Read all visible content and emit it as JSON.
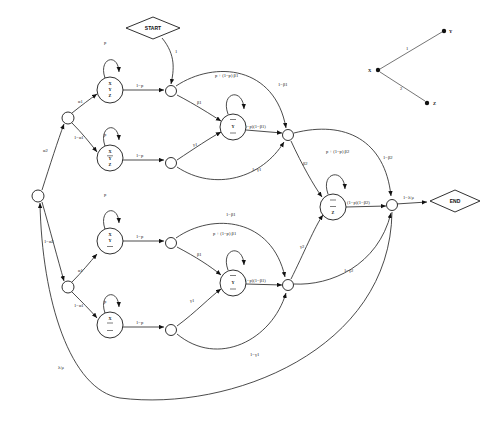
{
  "figure": {
    "type": "state-transition-diagram",
    "title": "",
    "terminals": {
      "start": "START",
      "end": "END"
    }
  },
  "nodes": [
    {
      "id": "n-split-a2",
      "kind": "small-circle",
      "label": "",
      "x": 38,
      "y": 196
    },
    {
      "id": "n-split-a1-top",
      "kind": "small-circle",
      "label": "",
      "x": 68,
      "y": 118
    },
    {
      "id": "n-xyz-top",
      "kind": "state",
      "lines": [
        "X",
        "Y",
        "Z"
      ],
      "bars": [
        false,
        false,
        false
      ],
      "x": 110,
      "y": 90
    },
    {
      "id": "n-xyzbar-top",
      "kind": "state",
      "lines": [
        "X",
        "Y",
        "Z"
      ],
      "bars": [
        false,
        true,
        false
      ],
      "x": 110,
      "y": 158
    },
    {
      "id": "n-merge-top",
      "kind": "small-circle",
      "label": "",
      "x": 171,
      "y": 91
    },
    {
      "id": "n-merge-top2",
      "kind": "small-circle",
      "label": "",
      "x": 171,
      "y": 163
    },
    {
      "id": "n-y-top",
      "kind": "state",
      "lines": [
        "X",
        "Y",
        "Z"
      ],
      "bars": [
        true,
        false,
        true
      ],
      "x": 233,
      "y": 127
    },
    {
      "id": "n-join-top",
      "kind": "small-circle",
      "label": "",
      "x": 288,
      "y": 135
    },
    {
      "id": "n-split-a1-bot",
      "kind": "small-circle",
      "label": "",
      "x": 68,
      "y": 287
    },
    {
      "id": "n-xyz-bot",
      "kind": "state",
      "lines": [
        "X",
        "Y",
        "Z"
      ],
      "bars": [
        false,
        false,
        true
      ],
      "x": 110,
      "y": 241
    },
    {
      "id": "n-xyzbar-bot",
      "kind": "state",
      "lines": [
        "X",
        "Y",
        "Z"
      ],
      "bars": [
        false,
        true,
        true
      ],
      "x": 110,
      "y": 325
    },
    {
      "id": "n-merge-bot",
      "kind": "small-circle",
      "label": "",
      "x": 171,
      "y": 243
    },
    {
      "id": "n-merge-bot2",
      "kind": "small-circle",
      "label": "",
      "x": 171,
      "y": 330
    },
    {
      "id": "n-y-bot",
      "kind": "state",
      "lines": [
        "X",
        "Y",
        "Z"
      ],
      "bars": [
        true,
        false,
        true
      ],
      "x": 233,
      "y": 283
    },
    {
      "id": "n-join-bot",
      "kind": "small-circle",
      "label": "",
      "x": 288,
      "y": 285
    },
    {
      "id": "n-z-right",
      "kind": "state",
      "lines": [
        "X",
        "Y",
        "Z"
      ],
      "bars": [
        true,
        true,
        false
      ],
      "x": 333,
      "y": 207
    },
    {
      "id": "n-join-right",
      "kind": "small-circle",
      "label": "",
      "x": 392,
      "y": 205
    }
  ],
  "edge_labels": {
    "start_to_merge": "1",
    "alpha2": "α2",
    "one_minus_alpha2": "1−α2",
    "alpha1_top": "α1",
    "one_minus_alpha1_top": "1−α1",
    "alpha1_bot": "α1",
    "one_minus_alpha1_bot": "1−α1",
    "self_p_1": "p",
    "self_p_2": "p",
    "self_p_3": "p",
    "self_p_4": "p",
    "one_minus_p_1": "1−p",
    "one_minus_p_2": "1−p",
    "one_minus_p_3": "1−p",
    "one_minus_p_4": "1−p",
    "beta1_top": "β1",
    "beta1_bot": "β1",
    "gamma1_top": "γ1",
    "gamma1_bot": "γ1",
    "one_minus_gamma1_top": "1−γ1",
    "one_minus_gamma1_bot": "1−γ1",
    "one_minus_beta1_top": "1−β1",
    "one_minus_beta1_bot": "1−β1",
    "self_y_top": "p + (1−p) β1",
    "self_y_bot": "p + (1−p) β1",
    "y_out_top": "(1−p)(1−β1)",
    "y_out_bot": "(1−p)(1−β1)",
    "beta2_top": "β2",
    "gamma2_bot": "γ2",
    "one_minus_gamma2": "1−γ2",
    "self_z": "p + (1−p) β2",
    "z_out": "(1−p)(1−β2)",
    "one_minus_beta2": "1−β2",
    "one_minus_lambda_mu": "1−λ/μ",
    "lambda_mu": "λ/μ"
  },
  "inset": {
    "name": "variable-dependency-graph",
    "nodes": [
      {
        "id": "X",
        "label": "X",
        "x": 378,
        "y": 70
      },
      {
        "id": "Y",
        "label": "Y",
        "x": 444,
        "y": 31
      },
      {
        "id": "Z",
        "label": "Z",
        "x": 427,
        "y": 103
      }
    ],
    "edges": [
      {
        "from": "X",
        "to": "Y",
        "label": "1"
      },
      {
        "from": "X",
        "to": "Z",
        "label": "2"
      }
    ]
  }
}
